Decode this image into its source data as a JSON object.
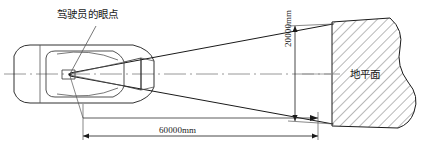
{
  "diagram": {
    "type": "engineering-top-view",
    "title_visible": false,
    "labels": {
      "eye_point": "驾驶员的眼点",
      "ground_plane": "地平面"
    },
    "dimensions": {
      "horizontal": {
        "value": "60000mm",
        "number": 60000,
        "unit": "mm",
        "orientation": "horizontal",
        "description": "distance from driver eye point to ground plane"
      },
      "vertical": {
        "value": "20000mm",
        "number": 20000,
        "unit": "mm",
        "orientation": "vertical",
        "description": "height of visible field at ground plane"
      }
    },
    "colors": {
      "line": "#1a1a1a",
      "thin_line": "#555555",
      "centerline": "#8c8c8c",
      "hatch": "#4d4d4d",
      "background": "#ffffff",
      "text": "#1a1a1a"
    },
    "elements": {
      "vehicle": "car-top-view-outline",
      "cone": "field-of-view-cone",
      "centerline": "dash-dot-axis",
      "ground": "hatched-ground-plane-with-break-line"
    }
  }
}
